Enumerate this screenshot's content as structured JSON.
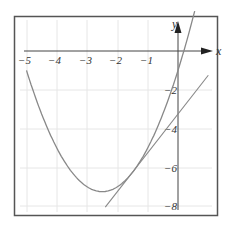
{
  "chart_data": {
    "type": "line",
    "title": "",
    "xlabel": "x",
    "ylabel": "y",
    "xlim": [
      -5,
      1
    ],
    "ylim": [
      -8,
      2
    ],
    "x_ticks": [
      "-5",
      "-4",
      "-3",
      "-2",
      "-1"
    ],
    "y_ticks": [
      "-2",
      "-4",
      "-6",
      "-8"
    ],
    "grid": true,
    "series": [
      {
        "name": "parabola y = x^2 + 5x - 1",
        "x": [
          -5,
          -4.5,
          -4,
          -3.5,
          -3,
          -2.5,
          -2,
          -1.5,
          -1,
          -0.5,
          0,
          0.5
        ],
        "values": [
          -1,
          -3.25,
          -5,
          -6.25,
          -7,
          -7.25,
          -7,
          -6.25,
          -5,
          -3.25,
          -1,
          1.75
        ]
      },
      {
        "name": "tangent line y = 2x - 3.25",
        "x": [
          -2.4,
          1
        ],
        "values": [
          -8.05,
          -1.25
        ]
      }
    ],
    "tangent_point": {
      "x": -1.5,
      "y": -6.25
    }
  },
  "labels": {
    "x_axis": "x",
    "y_axis": "y",
    "xt": [
      "−5",
      "−4",
      "−3",
      "−2",
      "−1"
    ],
    "yt": [
      "−2",
      "−4",
      "−6",
      "−8"
    ]
  }
}
